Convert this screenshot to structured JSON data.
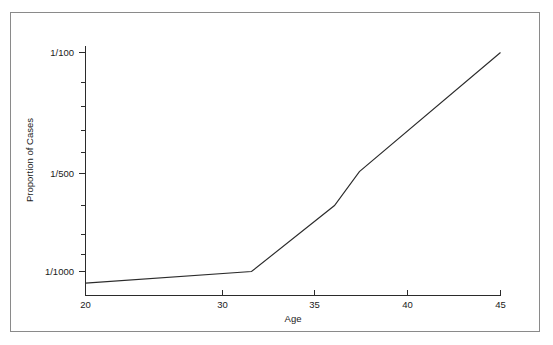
{
  "figure": {
    "background_color": "#ffffff",
    "frame_color": "#8a8a8a",
    "line_color": "#2b2b2b",
    "text_color": "#1a1a1a"
  },
  "chart_data": {
    "type": "line",
    "title": "",
    "xlabel": "Age",
    "ylabel": "Proportion of Cases",
    "xlim": [
      20,
      45
    ],
    "ylim_note": "logarithmic proportion axis, from about 1/1200 at bottom to 1/90 at top",
    "yscale": "log",
    "grid": false,
    "legend": false,
    "x_ticks": [
      20,
      30,
      35,
      40,
      45
    ],
    "x_tick_labels": [
      "20",
      "30",
      "35",
      "40",
      "45"
    ],
    "y_major_ticks": [
      0.01,
      0.002,
      0.001
    ],
    "y_major_tick_labels": [
      "1/100",
      "1/500",
      "1/1000"
    ],
    "y_minor_tick_count_upper": 4,
    "y_minor_tick_count_lower": 3,
    "series": [
      {
        "name": "Proportion of Cases",
        "x": [
          20,
          30,
          35,
          36.5,
          45
        ],
        "y_labels": [
          "1/1130",
          "1/1000",
          "1/500",
          "1/350",
          "1/100"
        ],
        "y": [
          0.000885,
          0.001,
          0.002,
          0.00286,
          0.01
        ]
      }
    ],
    "annotations": []
  },
  "axes": {
    "x_axis_title": "Age",
    "y_axis_title": "Proportion of Cases",
    "x_tick_labels": [
      "20",
      "30",
      "35",
      "40",
      "45"
    ],
    "y_tick_labels": [
      "1/100",
      "1/500",
      "1/1000"
    ]
  }
}
